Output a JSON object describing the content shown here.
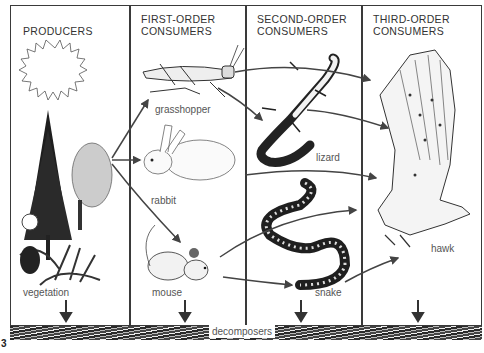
{
  "figure": {
    "number": "3",
    "type": "food web diagram"
  },
  "columns": [
    {
      "title": "PRODUCERS"
    },
    {
      "title": "FIRST-ORDER\nCONSUMERS"
    },
    {
      "title": "SECOND-ORDER\nCONSUMERS"
    },
    {
      "title": "THIRD-ORDER\nCONSUMERS"
    }
  ],
  "organisms": {
    "vegetation": "vegetation",
    "grasshopper": "grasshopper",
    "rabbit": "rabbit",
    "mouse": "mouse",
    "lizard": "lizard",
    "snake": "snake",
    "hawk": "hawk"
  },
  "decomposers": {
    "label": "decomposers"
  },
  "arrows": [
    {
      "from": "vegetation",
      "to": "grasshopper"
    },
    {
      "from": "vegetation",
      "to": "rabbit"
    },
    {
      "from": "vegetation",
      "to": "mouse"
    },
    {
      "from": "grasshopper",
      "to": "lizard"
    },
    {
      "from": "grasshopper",
      "to": "hawk"
    },
    {
      "from": "lizard",
      "to": "hawk"
    },
    {
      "from": "rabbit",
      "to": "hawk"
    },
    {
      "from": "mouse",
      "to": "snake"
    },
    {
      "from": "mouse",
      "to": "hawk"
    },
    {
      "from": "snake",
      "to": "hawk"
    },
    {
      "from": "vegetation",
      "to": "decomposers"
    },
    {
      "from": "mouse",
      "to": "decomposers"
    },
    {
      "from": "snake",
      "to": "decomposers"
    },
    {
      "from": "hawk",
      "to": "decomposers"
    }
  ]
}
